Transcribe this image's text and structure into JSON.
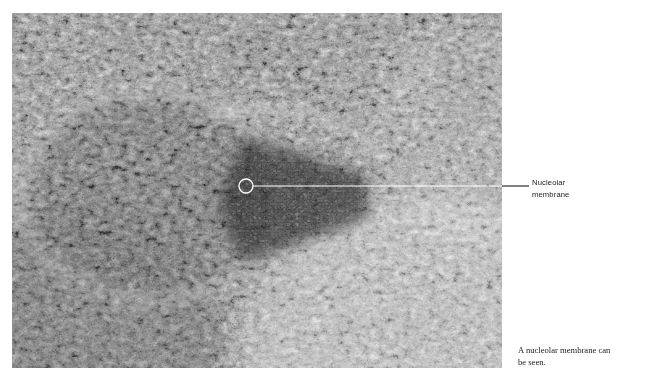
{
  "figure": {
    "type": "electron-micrograph",
    "plate": {
      "x": 12,
      "y": 13,
      "width": 490,
      "height": 355,
      "palette": {
        "background": "#8d8d8d",
        "light": "#f2f2f2",
        "mid": "#9a9a9a",
        "dark": "#3a3a3a",
        "darkest": "#141414"
      }
    }
  },
  "annotations": [
    {
      "id": "nucleolar-membrane",
      "marker": {
        "shape": "circle",
        "cx": 246,
        "cy": 186,
        "r": 7,
        "stroke": "#ffffff",
        "stroke_width": 1.2
      },
      "leader": {
        "inside_color": "#ffffff",
        "outside_color": "#1a1a1a",
        "y": 186,
        "x_start": 253,
        "x_plate_edge": 502,
        "x_end": 529,
        "stroke_width": 1.1
      },
      "label_lines": [
        "Nucleolar",
        "membrane"
      ]
    }
  ],
  "caption": {
    "lines": [
      "A nucleolar membrane can",
      "be seen."
    ],
    "text": "A nucleolar membrane can be seen."
  }
}
